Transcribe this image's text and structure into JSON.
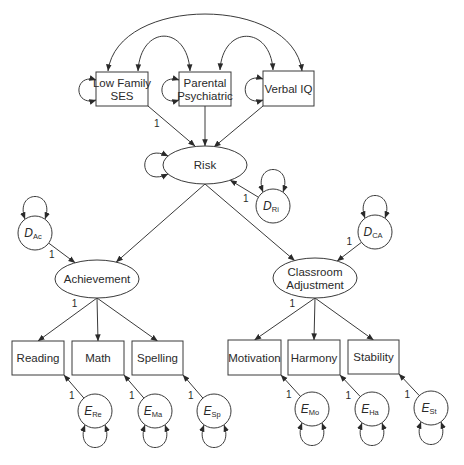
{
  "diagram": {
    "observed_predictors": [
      {
        "id": "ses",
        "lines": [
          "Low Family",
          "SES"
        ],
        "x": 96,
        "y": 72,
        "w": 52,
        "h": 34
      },
      {
        "id": "psych",
        "lines": [
          "Parental",
          "Psychiatric"
        ],
        "x": 179,
        "y": 72,
        "w": 52,
        "h": 34
      },
      {
        "id": "viq",
        "lines": [
          "Verbal IQ"
        ],
        "x": 263,
        "y": 71,
        "w": 51,
        "h": 35
      }
    ],
    "latents": [
      {
        "id": "risk",
        "lines": [
          "Risk"
        ],
        "cx": 205,
        "cy": 165,
        "rx": 42,
        "ry": 19
      },
      {
        "id": "ach",
        "lines": [
          "Achievement"
        ],
        "cx": 97,
        "cy": 279,
        "rx": 42,
        "ry": 19
      },
      {
        "id": "ca",
        "lines": [
          "Classroom",
          "Adjustment"
        ],
        "cx": 315,
        "cy": 278,
        "rx": 42,
        "ry": 20
      }
    ],
    "disturbances": [
      {
        "id": "dri",
        "letter": "D",
        "sub": "Ri",
        "cx": 273,
        "cy": 206,
        "r": 17
      },
      {
        "id": "dac",
        "letter": "D",
        "sub": "Ac",
        "cx": 35,
        "cy": 233,
        "r": 17
      },
      {
        "id": "dca",
        "letter": "D",
        "sub": "CA",
        "cx": 375,
        "cy": 232,
        "r": 17
      }
    ],
    "indicators": [
      {
        "id": "reading",
        "label": "Reading",
        "x": 12,
        "y": 341,
        "w": 52,
        "h": 34
      },
      {
        "id": "math",
        "label": "Math",
        "x": 72,
        "y": 341,
        "w": 52,
        "h": 34
      },
      {
        "id": "spelling",
        "label": "Spelling",
        "x": 132,
        "y": 341,
        "w": 51,
        "h": 34
      },
      {
        "id": "motivation",
        "label": "Motivation",
        "x": 228,
        "y": 340,
        "w": 53,
        "h": 35
      },
      {
        "id": "harmony",
        "label": "Harmony",
        "x": 288,
        "y": 340,
        "w": 52,
        "h": 35
      },
      {
        "id": "stability",
        "label": "Stability",
        "x": 348,
        "y": 340,
        "w": 51,
        "h": 34
      }
    ],
    "errors": [
      {
        "id": "ere",
        "letter": "E",
        "sub": "Re",
        "cx": 95,
        "cy": 411,
        "r": 17
      },
      {
        "id": "ema",
        "letter": "E",
        "sub": "Ma",
        "cx": 155,
        "cy": 411,
        "r": 17
      },
      {
        "id": "esp",
        "letter": "E",
        "sub": "Sp",
        "cx": 214,
        "cy": 411,
        "r": 17
      },
      {
        "id": "emo",
        "letter": "E",
        "sub": "Mo",
        "cx": 312,
        "cy": 409,
        "r": 17
      },
      {
        "id": "eha",
        "letter": "E",
        "sub": "Ha",
        "cx": 372,
        "cy": 409,
        "r": 17
      },
      {
        "id": "est",
        "letter": "E",
        "sub": "St",
        "cx": 431,
        "cy": 408,
        "r": 17
      }
    ],
    "fixed_path_label": "1",
    "paths": [
      {
        "from": "ses",
        "to": "risk",
        "label": "1"
      },
      {
        "from": "psych",
        "to": "risk",
        "label": ""
      },
      {
        "from": "viq",
        "to": "risk",
        "label": ""
      },
      {
        "from": "dri",
        "to": "risk",
        "label": "1"
      },
      {
        "from": "risk",
        "to": "ach",
        "label": ""
      },
      {
        "from": "risk",
        "to": "ca",
        "label": ""
      },
      {
        "from": "dac",
        "to": "ach",
        "label": "1"
      },
      {
        "from": "dca",
        "to": "ca",
        "label": "1"
      },
      {
        "from": "ach",
        "to": "reading",
        "label": "1"
      },
      {
        "from": "ach",
        "to": "math",
        "label": ""
      },
      {
        "from": "ach",
        "to": "spelling",
        "label": ""
      },
      {
        "from": "ca",
        "to": "motivation",
        "label": "1"
      },
      {
        "from": "ca",
        "to": "harmony",
        "label": ""
      },
      {
        "from": "ca",
        "to": "stability",
        "label": ""
      },
      {
        "from": "ere",
        "to": "reading",
        "label": "1"
      },
      {
        "from": "ema",
        "to": "math",
        "label": "1"
      },
      {
        "from": "esp",
        "to": "spelling",
        "label": "1"
      },
      {
        "from": "emo",
        "to": "motivation",
        "label": "1"
      },
      {
        "from": "eha",
        "to": "harmony",
        "label": "1"
      },
      {
        "from": "est",
        "to": "stability",
        "label": "1"
      }
    ],
    "covariances": [
      {
        "from": "ses",
        "to": "viq"
      },
      {
        "from": "ses",
        "to": "psych"
      },
      {
        "from": "psych",
        "to": "viq"
      }
    ],
    "colors": {
      "stroke": "#3a3a3a",
      "text": "#2a2a2a",
      "background": "#ffffff"
    }
  }
}
